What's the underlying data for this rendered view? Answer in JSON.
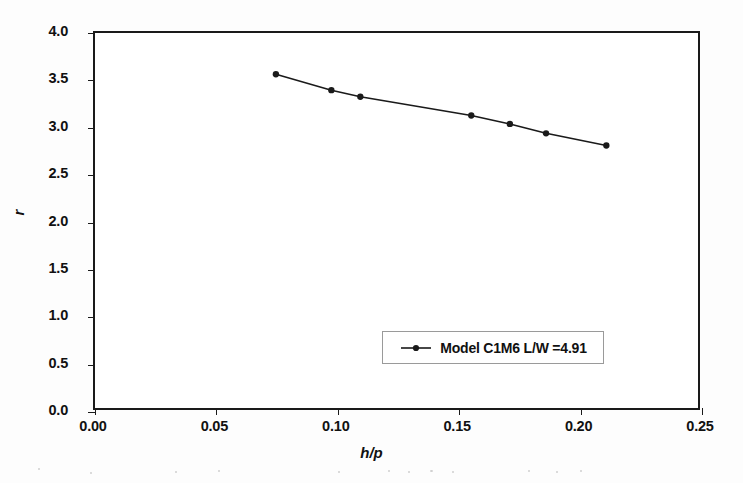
{
  "chart_data": {
    "type": "line",
    "title": "",
    "xlabel": "h/p",
    "ylabel": "r",
    "xlim": [
      0.0,
      0.25
    ],
    "ylim": [
      0.0,
      4.0
    ],
    "xticks": [
      "0.00",
      "0.05",
      "0.10",
      "0.15",
      "0.20",
      "0.25"
    ],
    "xtick_values": [
      0.0,
      0.05,
      0.1,
      0.15,
      0.2,
      0.25
    ],
    "yticks": [
      "0.0",
      "0.5",
      "1.0",
      "1.5",
      "2.0",
      "2.5",
      "3.0",
      "3.5",
      "4.0"
    ],
    "ytick_values": [
      0.0,
      0.5,
      1.0,
      1.5,
      2.0,
      2.5,
      3.0,
      3.5,
      4.0
    ],
    "grid": false,
    "legend_position": "lower-right",
    "series": [
      {
        "name": "Model C1M6 L/W =4.91",
        "marker": "filled-circle",
        "color": "#1a1a1a",
        "x": [
          0.075,
          0.098,
          0.11,
          0.156,
          0.172,
          0.187,
          0.212
        ],
        "y": [
          3.56,
          3.39,
          3.32,
          3.12,
          3.03,
          2.93,
          2.8
        ]
      }
    ]
  },
  "legend": {
    "entries": [
      {
        "label": "Model C1M6 L/W =4.91"
      }
    ]
  },
  "axes": {
    "x_title": "h/p",
    "y_title": "r"
  }
}
